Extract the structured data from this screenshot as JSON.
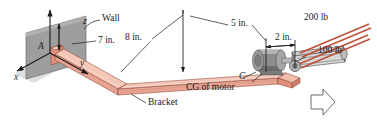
{
  "figure": {
    "background": "#ffffff"
  },
  "colors": {
    "bracket_face": "#e8a492",
    "bracket_top": "#f4c7b9",
    "bracket_shadow": "#cf8070",
    "bracket_edge": "#8d4534",
    "wall": "#9b9b9b",
    "wall_edge": "#6f6f6f",
    "motor_body": "#8d8d8d",
    "motor_dark": "#6a6a6a",
    "motor_light": "#c3c3c3",
    "belt": "#c0503a",
    "line": "#1b1b1b",
    "floor": "#d7d7d7"
  },
  "axes": {
    "x": "x",
    "y": "y",
    "z": "z"
  },
  "labels": {
    "point_a": "A",
    "point_c": "C",
    "wall": "Wall",
    "bracket": "Bracket",
    "cg_of_motor": "CG of motor"
  },
  "dimensions": [
    {
      "id": "dim-7in",
      "text": "7 in."
    },
    {
      "id": "dim-8in",
      "text": "8 in."
    },
    {
      "id": "dim-5in",
      "text": "5 in."
    },
    {
      "id": "dim-2in",
      "text": "2 in."
    }
  ],
  "forces": [
    {
      "id": "force-200lb",
      "text": "200 lb"
    },
    {
      "id": "force-100lb",
      "text": "100 lb"
    }
  ],
  "direction_arrow": {
    "name": "view-direction-arrow",
    "points": "right"
  }
}
